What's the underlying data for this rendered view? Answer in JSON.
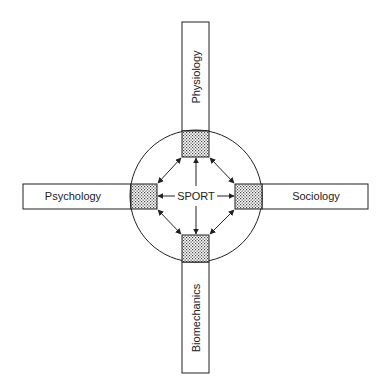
{
  "diagram": {
    "center_label": "SPORT",
    "disciplines": {
      "top": "Physiology",
      "left": "Psychology",
      "right": "Sociology",
      "bottom": "Biomechanics"
    },
    "colors": {
      "stroke": "#222222",
      "background": "#ffffff",
      "hatch": "#555555"
    }
  }
}
